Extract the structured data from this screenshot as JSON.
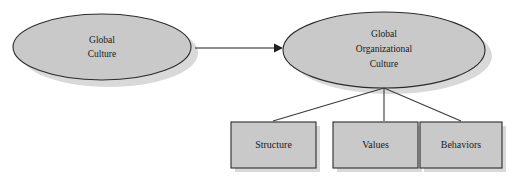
{
  "diagram": {
    "background_color": "#ffffff",
    "shape_fill_color": "#c9c9c9",
    "shape_border_color": "#2b2b2b",
    "shadow_color": "#d9d9d9",
    "text_color": "#1a1a1a",
    "ellipses": [
      {
        "id": "global-culture",
        "lines": [
          "Global",
          "Culture"
        ],
        "line1": "Global",
        "line2": "Culture",
        "line3": ""
      },
      {
        "id": "global-organizational-culture",
        "lines": [
          "Global",
          "Organizational",
          "Culture"
        ],
        "line1": "Global",
        "line2": "Organizational",
        "line3": "Culture"
      }
    ],
    "boxes": [
      {
        "id": "structure",
        "label": "Structure"
      },
      {
        "id": "values",
        "label": "Values"
      },
      {
        "id": "behaviors",
        "label": "Behaviors"
      }
    ],
    "arrow": {
      "id": "culture-to-org-culture",
      "from": "global-culture",
      "to": "global-organizational-culture",
      "label": ""
    },
    "connectors": [
      {
        "from": "global-organizational-culture",
        "to": "structure"
      },
      {
        "from": "global-organizational-culture",
        "to": "values"
      },
      {
        "from": "global-organizational-culture",
        "to": "behaviors"
      }
    ]
  }
}
